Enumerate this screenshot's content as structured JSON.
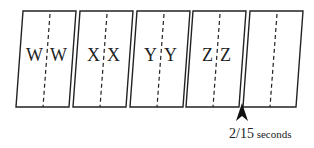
{
  "diagram": {
    "frames": [
      {
        "left": "W",
        "right": "W",
        "x": 23
      },
      {
        "left": "X",
        "right": "X",
        "x": 80
      },
      {
        "left": "Y",
        "right": "Y",
        "x": 137
      },
      {
        "left": "Z",
        "right": "Z",
        "x": 193
      },
      {
        "left": "",
        "right": "",
        "x": 250
      }
    ],
    "geometry": {
      "top_y": 11,
      "bottom_y": 107,
      "width": 53,
      "skew": 7
    },
    "marker": {
      "tip_x": 242,
      "tip_y": 103,
      "label_number": "2/15",
      "label_unit": " seconds"
    },
    "colors": {
      "stroke": "#222222",
      "background": "#ffffff"
    }
  }
}
